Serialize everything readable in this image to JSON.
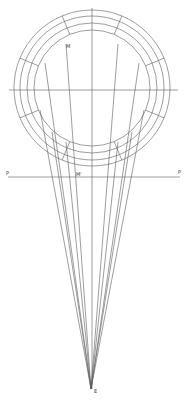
{
  "diagram": {
    "type": "perspective-construction",
    "stroke_color": "#5a5a5a",
    "center": {
      "x": 92,
      "y": 88
    },
    "circles_r": [
      78,
      72,
      65,
      58
    ],
    "radial_angles_deg": [
      22.5,
      67.5,
      112.5,
      157.5,
      202.5,
      247.5,
      292.5,
      337.5
    ],
    "horizontal_axis": {
      "x1": 9,
      "x2": 178,
      "y": 90
    },
    "vertical_axis": {
      "x": 92,
      "y1": 8,
      "y2": 389
    },
    "picture_plane": {
      "x1": 8,
      "x2": 180,
      "y": 177
    },
    "eye_point": {
      "x": 91,
      "y": 389
    },
    "sight_line_targets": [
      {
        "x": 66,
        "y": 44
      },
      {
        "x": 45,
        "y": 63
      },
      {
        "x": 40,
        "y": 110
      },
      {
        "x": 52,
        "y": 132
      },
      {
        "x": 66,
        "y": 142
      },
      {
        "x": 118,
        "y": 44
      },
      {
        "x": 139,
        "y": 63
      },
      {
        "x": 144,
        "y": 110
      },
      {
        "x": 132,
        "y": 132
      },
      {
        "x": 118,
        "y": 142
      }
    ]
  },
  "labels": {
    "M": "M",
    "M_prime": "M'",
    "P_left": "P",
    "P_right": "P",
    "E": "E"
  }
}
